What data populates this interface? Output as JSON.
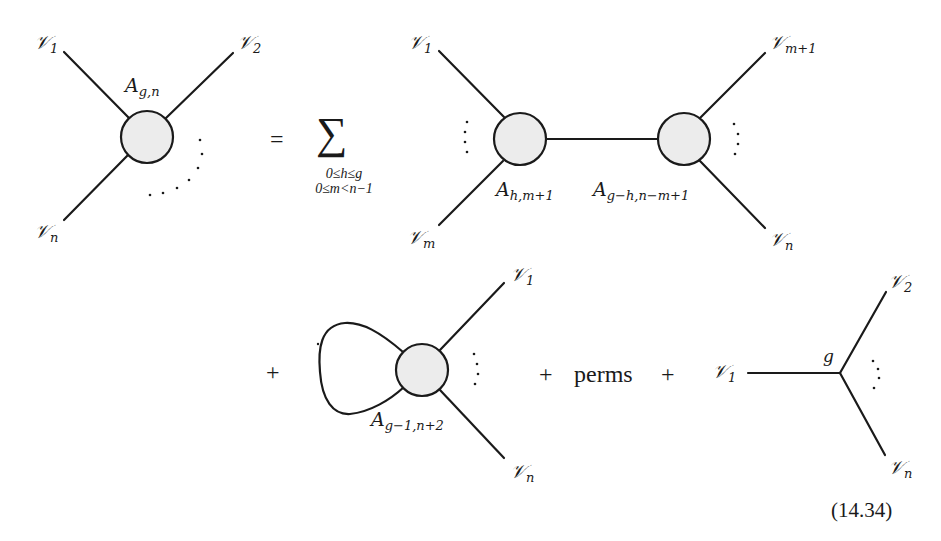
{
  "equation": {
    "number": "(14.34)",
    "equals": "=",
    "sum_symbol": "∑",
    "sum_index_line1": "0≤h≤g",
    "sum_index_line2": "0≤m<n−1",
    "plus": "+",
    "perms": "perms"
  },
  "colors": {
    "stroke": "#1a1a1a",
    "blob_fill": "#ececec",
    "background": "#ffffff"
  },
  "lhs": {
    "vertex_label": {
      "base": "A",
      "sub": "g,n"
    },
    "legs": [
      {
        "base": "𝒱",
        "sub": "1"
      },
      {
        "base": "𝒱",
        "sub": "2"
      },
      {
        "base": "𝒱",
        "sub": "n"
      }
    ]
  },
  "term_separating": {
    "left_vertex_label": {
      "base": "A",
      "sub": "h,m+1"
    },
    "right_vertex_label": {
      "base": "A",
      "sub": "g−h,n−m+1"
    },
    "legs": [
      {
        "base": "𝒱",
        "sub": "1"
      },
      {
        "base": "𝒱",
        "sub": "m"
      },
      {
        "base": "𝒱",
        "sub": "m+1"
      },
      {
        "base": "𝒱",
        "sub": "n"
      }
    ]
  },
  "term_loop": {
    "vertex_label": {
      "base": "A",
      "sub": "g−1,n+2"
    },
    "legs": [
      {
        "base": "𝒱",
        "sub": "1"
      },
      {
        "base": "𝒱",
        "sub": "n"
      }
    ]
  },
  "term_base": {
    "vertex_label": "g",
    "legs": [
      {
        "base": "𝒱",
        "sub": "1"
      },
      {
        "base": "𝒱",
        "sub": "2"
      },
      {
        "base": "𝒱",
        "sub": "n"
      }
    ]
  }
}
